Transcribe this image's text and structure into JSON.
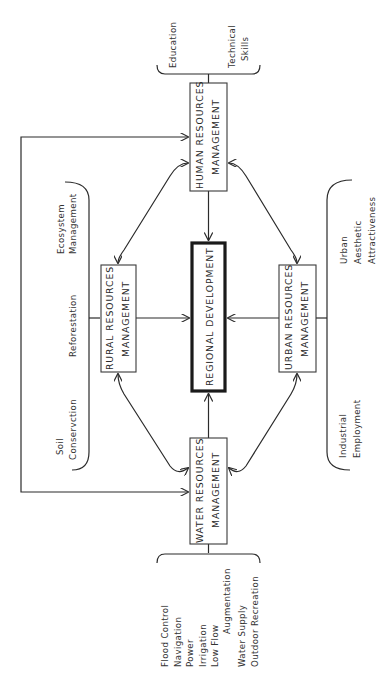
{
  "diagram": {
    "orientation": "rotated-90-ccw",
    "center": {
      "line1": "REGIONAL  DEVELOPMENT"
    },
    "nodes": {
      "human": {
        "line1": "HUMAN  RESOURCES",
        "line2": "MANAGEMENT"
      },
      "rural": {
        "line1": "RURAL  RESOURCES",
        "line2": "MANAGEMENT"
      },
      "urban": {
        "line1": "URBAN  RESOURCES",
        "line2": "MANAGEMENT"
      },
      "water": {
        "line1": "WATER  RESOURCES",
        "line2": "MANAGEMENT"
      }
    },
    "human_factors": {
      "education": "Education",
      "technical_1": "Technical",
      "technical_2": "Skills"
    },
    "rural_factors": {
      "soil_1": "Soil",
      "soil_2": "Conservction",
      "reforestation": "Reforestation",
      "ecosystem_1": "Ecosystem",
      "ecosystem_2": "Management"
    },
    "urban_factors": {
      "industrial_1": "Industrial",
      "industrial_2": "Employment",
      "urban_1": "Urban",
      "urban_2": "Aesthetic",
      "urban_3": "Attractiveness"
    },
    "water_factors": {
      "flood": "Flood  Control",
      "navigation": "Navigation",
      "power": "Power",
      "irrigation": "Irrigation",
      "lowflow": "Low  Flow",
      "augmentation": "Augmentation",
      "supply": "Water  Supply",
      "recreation": "Outdoor  Recreation"
    },
    "colors": {
      "ink": "#2b2b2b",
      "background": "#ffffff"
    }
  }
}
